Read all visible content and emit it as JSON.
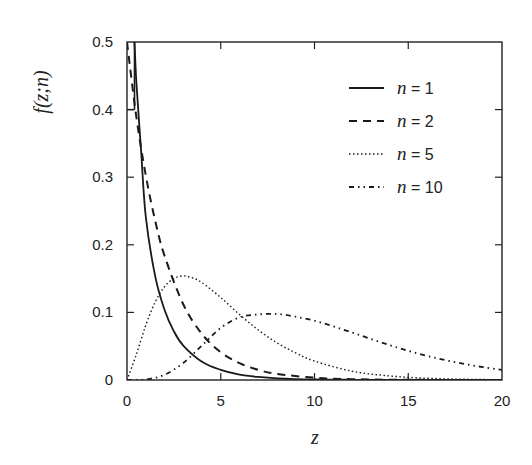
{
  "chart_data": {
    "type": "line",
    "title": "",
    "xlabel": "z",
    "ylabel": "f(z;n)",
    "xlim": [
      0,
      20
    ],
    "ylim": [
      0,
      0.5
    ],
    "grid": false,
    "legend_position": "top-right",
    "x_ticks": [
      0,
      5,
      10,
      15,
      20
    ],
    "x_tick_labels": [
      "0",
      "5",
      "10",
      "15",
      "20"
    ],
    "y_ticks": [
      0,
      0.1,
      0.2,
      0.3,
      0.4,
      0.5
    ],
    "y_tick_labels": [
      "0",
      "0.1",
      "0.2",
      "0.3",
      "0.4",
      "0.5"
    ],
    "series": [
      {
        "name": "n = 1",
        "n": 1,
        "style": "solid",
        "x": [
          0.4,
          0.5,
          0.75,
          1,
          1.5,
          2,
          2.5,
          3,
          4,
          5,
          6,
          7,
          8,
          10,
          12,
          15,
          20
        ],
        "y": [
          0.5,
          0.44,
          0.34,
          0.242,
          0.154,
          0.104,
          0.072,
          0.051,
          0.027,
          0.015,
          0.008,
          0.0045,
          0.0025,
          0.0008,
          0.0003,
          0.0001,
          0.0
        ]
      },
      {
        "name": "n = 2",
        "n": 2,
        "style": "dashed",
        "x": [
          0,
          0.5,
          1,
          1.5,
          2,
          3,
          4,
          5,
          6,
          7,
          8,
          10,
          12,
          15,
          20
        ],
        "y": [
          0.5,
          0.389,
          0.303,
          0.236,
          0.184,
          0.112,
          0.068,
          0.041,
          0.025,
          0.015,
          0.009,
          0.0034,
          0.0012,
          0.0003,
          0.0
        ]
      },
      {
        "name": "n = 5",
        "n": 5,
        "style": "dotted",
        "x": [
          0,
          0.5,
          1,
          1.5,
          2,
          2.5,
          3,
          3.5,
          4,
          5,
          6,
          7,
          8,
          9,
          10,
          12,
          14,
          16,
          18,
          20
        ],
        "y": [
          0,
          0.038,
          0.081,
          0.115,
          0.138,
          0.15,
          0.154,
          0.151,
          0.144,
          0.122,
          0.097,
          0.074,
          0.055,
          0.04,
          0.028,
          0.013,
          0.006,
          0.0026,
          0.0011,
          0.0004
        ]
      },
      {
        "name": "n = 10",
        "n": 10,
        "style": "dash-dot-dot",
        "x": [
          0,
          1,
          2,
          3,
          4,
          5,
          6,
          7,
          8,
          9,
          10,
          11,
          12,
          13,
          14,
          15,
          16,
          17,
          18,
          19,
          20
        ],
        "y": [
          0,
          0.0008,
          0.0077,
          0.0251,
          0.0511,
          0.0771,
          0.0927,
          0.097,
          0.0977,
          0.0936,
          0.0877,
          0.0794,
          0.0703,
          0.0608,
          0.0517,
          0.0432,
          0.0357,
          0.0292,
          0.0237,
          0.0189,
          0.015
        ]
      }
    ]
  }
}
